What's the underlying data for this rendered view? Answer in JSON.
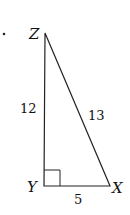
{
  "diagram": {
    "type": "right-triangle",
    "bullet": "•",
    "vertices": {
      "Z": {
        "label": "Z",
        "x": 45,
        "y": 33
      },
      "Y": {
        "label": "Y",
        "x": 44,
        "y": 186
      },
      "X": {
        "label": "X",
        "x": 110,
        "y": 186
      }
    },
    "sides": {
      "ZY": {
        "label": "12"
      },
      "ZX": {
        "label": "13"
      },
      "YX": {
        "label": "5"
      }
    },
    "right_angle_at": "Y",
    "colors": {
      "stroke": "#222222",
      "text": "#111111",
      "background": "#ffffff"
    }
  }
}
